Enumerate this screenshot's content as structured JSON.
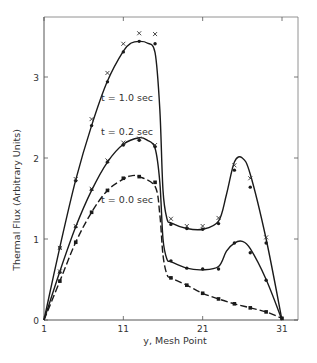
{
  "chart_data": {
    "type": "line",
    "title": "",
    "xlabel": "y, Mesh Point",
    "ylabel": "Thermal Flux (Arbitrary Units)",
    "xlim": [
      1,
      31
    ],
    "ylim": [
      0,
      3.7
    ],
    "xticks": [
      1,
      11,
      21,
      31
    ],
    "yticks": [
      0,
      1,
      2,
      3
    ],
    "grid": false,
    "legend": "inline curve labels",
    "series": [
      {
        "name": "t = 1.0 sec",
        "label_pos": [
          8.2,
          2.7
        ],
        "curve": [
          [
            1,
            0
          ],
          [
            3,
            0.9
          ],
          [
            5,
            1.73
          ],
          [
            7,
            2.4
          ],
          [
            9,
            2.95
          ],
          [
            11,
            3.32
          ],
          [
            12,
            3.42
          ],
          [
            13,
            3.44
          ],
          [
            14,
            3.42
          ],
          [
            15,
            3.3
          ],
          [
            15.6,
            2.6
          ],
          [
            16,
            1.6
          ],
          [
            16.5,
            1.25
          ],
          [
            17,
            1.2
          ],
          [
            19,
            1.13
          ],
          [
            21,
            1.12
          ],
          [
            23,
            1.22
          ],
          [
            24,
            1.55
          ],
          [
            25,
            1.95
          ],
          [
            26,
            2.0
          ],
          [
            27,
            1.8
          ],
          [
            29,
            1.0
          ],
          [
            31,
            0
          ]
        ],
        "markers_dot": [
          [
            3,
            0.89
          ],
          [
            5,
            1.72
          ],
          [
            7,
            2.4
          ],
          [
            9,
            2.94
          ],
          [
            11,
            3.31
          ],
          [
            13,
            3.44
          ],
          [
            15,
            3.41
          ],
          [
            17,
            1.18
          ],
          [
            19,
            1.13
          ],
          [
            21,
            1.12
          ],
          [
            23,
            1.19
          ],
          [
            25,
            1.85
          ],
          [
            27,
            1.64
          ],
          [
            29,
            0.95
          ]
        ],
        "markers_x": [
          [
            3,
            0.89
          ],
          [
            5,
            1.74
          ],
          [
            7,
            2.48
          ],
          [
            9,
            3.05
          ],
          [
            11,
            3.41
          ],
          [
            13,
            3.54
          ],
          [
            15,
            3.53
          ],
          [
            17,
            1.25
          ],
          [
            19,
            1.16
          ],
          [
            21,
            1.16
          ],
          [
            23,
            1.26
          ],
          [
            25,
            1.91
          ],
          [
            27,
            1.75
          ],
          [
            29,
            1.02
          ]
        ]
      },
      {
        "name": "t = 0.2 sec",
        "label_pos": [
          8.2,
          2.28
        ],
        "curve": [
          [
            1,
            0
          ],
          [
            3,
            0.6
          ],
          [
            5,
            1.15
          ],
          [
            7,
            1.6
          ],
          [
            9,
            1.95
          ],
          [
            11,
            2.17
          ],
          [
            13,
            2.25
          ],
          [
            14,
            2.22
          ],
          [
            15,
            2.12
          ],
          [
            15.6,
            1.7
          ],
          [
            16,
            1.0
          ],
          [
            16.5,
            0.75
          ],
          [
            17,
            0.72
          ],
          [
            19,
            0.64
          ],
          [
            21,
            0.62
          ],
          [
            23,
            0.66
          ],
          [
            24,
            0.85
          ],
          [
            25,
            0.95
          ],
          [
            26,
            0.97
          ],
          [
            27,
            0.88
          ],
          [
            29,
            0.5
          ],
          [
            31,
            0
          ]
        ],
        "markers_dot": [
          [
            3,
            0.59
          ],
          [
            5,
            1.15
          ],
          [
            7,
            1.61
          ],
          [
            9,
            1.95
          ],
          [
            11,
            2.16
          ],
          [
            13,
            2.22
          ],
          [
            15,
            2.14
          ],
          [
            17,
            0.73
          ],
          [
            19,
            0.64
          ],
          [
            21,
            0.63
          ],
          [
            23,
            0.63
          ],
          [
            25,
            0.95
          ],
          [
            27,
            0.83
          ],
          [
            29,
            0.49
          ]
        ],
        "markers_x": [
          [
            3,
            0.6
          ],
          [
            5,
            1.16
          ],
          [
            7,
            1.62
          ],
          [
            9,
            1.97
          ],
          [
            11,
            2.19
          ],
          [
            13,
            2.24
          ],
          [
            15,
            2.16
          ]
        ]
      },
      {
        "name": "t = 0.0 sec",
        "label_pos": [
          8.2,
          1.45
        ],
        "dashed": true,
        "curve": [
          [
            1,
            0
          ],
          [
            3,
            0.48
          ],
          [
            5,
            0.96
          ],
          [
            7,
            1.33
          ],
          [
            9,
            1.6
          ],
          [
            11,
            1.74
          ],
          [
            12,
            1.78
          ],
          [
            13,
            1.77
          ],
          [
            15,
            1.65
          ],
          [
            15.6,
            1.3
          ],
          [
            16,
            0.8
          ],
          [
            16.5,
            0.56
          ],
          [
            17,
            0.52
          ],
          [
            19,
            0.43
          ],
          [
            21,
            0.33
          ],
          [
            23,
            0.26
          ],
          [
            25,
            0.2
          ],
          [
            27,
            0.15
          ],
          [
            29,
            0.1
          ],
          [
            31,
            0.02
          ]
        ],
        "markers_square": [
          [
            3,
            0.48
          ],
          [
            5,
            0.96
          ],
          [
            7,
            1.33
          ],
          [
            9,
            1.6
          ],
          [
            11,
            1.75
          ],
          [
            13,
            1.77
          ],
          [
            15,
            1.7
          ],
          [
            17,
            0.52
          ],
          [
            19,
            0.43
          ],
          [
            21,
            0.33
          ],
          [
            23,
            0.26
          ],
          [
            25,
            0.2
          ],
          [
            27,
            0.15
          ],
          [
            29,
            0.1
          ],
          [
            31,
            0.02
          ]
        ]
      }
    ]
  }
}
